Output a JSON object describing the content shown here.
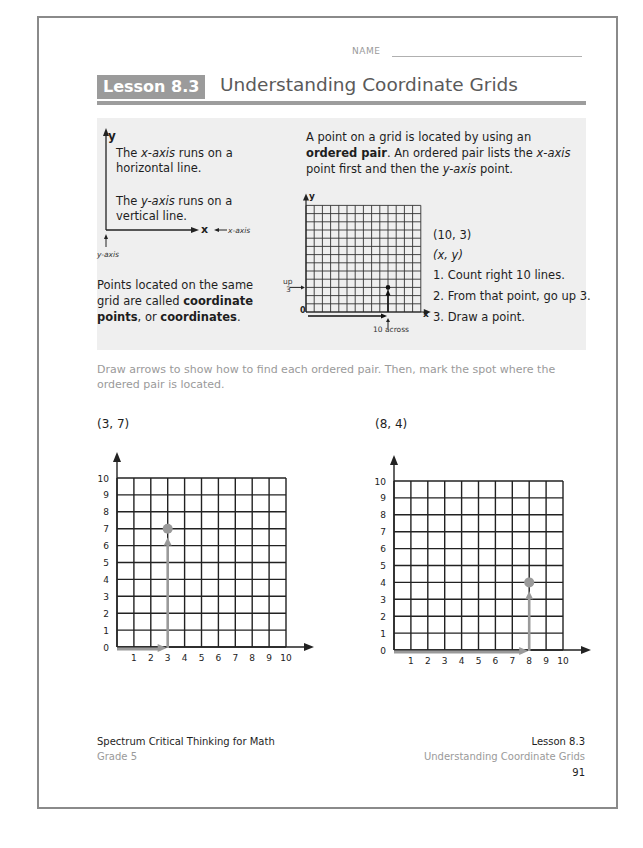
{
  "header": {
    "name_label": "NAME",
    "lesson_badge": "Lesson 8.3",
    "lesson_title": "Understanding Coordinate Grids"
  },
  "intro": {
    "axis_demo": {
      "y_label": "y",
      "x_label": "x",
      "x_axis_pointer": "x-axis",
      "y_axis_pointer": "y-axis",
      "x_axis_text_pre": "The ",
      "x_axis_text_em": "x-axis",
      "x_axis_text_post": " runs on a horizontal line.",
      "y_axis_text_pre": "The ",
      "y_axis_text_em": "y-axis",
      "y_axis_text_post": " runs on a vertical line."
    },
    "coordinates_text": {
      "pre": "Points located on the same grid are called ",
      "bold1": "coordinate points",
      "mid": ", or ",
      "bold2": "coordinates",
      "post": "."
    },
    "ordered_pair_text": {
      "pre": "A point on a grid is located by using an ",
      "bold": "ordered pair",
      "mid": ". An ordered pair lists the ",
      "em1": "x-axis",
      "mid2": " point first and then the ",
      "em2": "y-axis",
      "post": " point."
    },
    "example_grid": {
      "y_label": "y",
      "x_label": "x",
      "origin_label": "0",
      "up_label": "up",
      "up_value": "3",
      "across_label": "10 across",
      "columns": 14,
      "rows": 13,
      "point": [
        10,
        3
      ]
    },
    "example_pair": "(10, 3)",
    "example_format": "(x, y)",
    "steps": [
      "1. Count right 10 lines.",
      "2. From that point, go up 3.",
      "3. Draw a point."
    ]
  },
  "instructions": "Draw arrows to show how to find each ordered pair. Then, mark the spot where the ordered pair is located.",
  "problems": [
    {
      "label": "(3, 7)",
      "x": 3,
      "y": 7
    },
    {
      "label": "(8, 4)",
      "x": 8,
      "y": 4
    }
  ],
  "grid_ticks": [
    "0",
    "1",
    "2",
    "3",
    "4",
    "5",
    "6",
    "7",
    "8",
    "9",
    "10"
  ],
  "footer": {
    "book_title": "Spectrum Critical Thinking for Math",
    "grade": "Grade 5",
    "lesson": "Lesson 8.3",
    "lesson_title": "Understanding Coordinate Grids",
    "page_number": "91"
  },
  "colors": {
    "answer_gray": "#9a9a9a",
    "badge_gray": "#9b9b9b",
    "box_gray": "#efefef"
  }
}
